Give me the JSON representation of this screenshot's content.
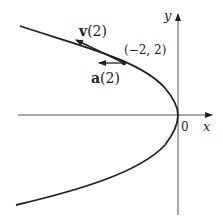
{
  "figure": {
    "curve": "x = -y^2/2 (parabola opening left)",
    "axes": {
      "x_label": "x",
      "y_label": "y",
      "origin_label": "0"
    },
    "point": {
      "label": "(−2, 2)",
      "x": -2,
      "y": 2
    },
    "vectors": [
      {
        "name": "velocity",
        "label_bold": "v",
        "label_arg": "(2)",
        "direction": "tangent, up-left"
      },
      {
        "name": "acceleration",
        "label_bold": "a",
        "label_arg": "(2)",
        "direction": "left (−x)"
      }
    ],
    "colors": {
      "ink": "#222222",
      "axis": "#555555",
      "background": "#ffffff"
    }
  }
}
